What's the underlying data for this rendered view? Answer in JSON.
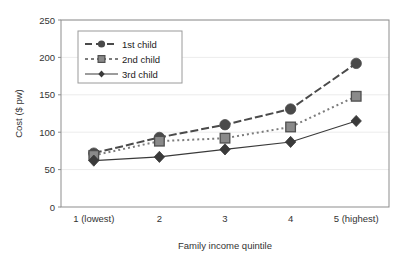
{
  "chart_data": {
    "type": "line",
    "title": "",
    "xlabel": "Family income quintile",
    "ylabel": "Cost ($ pw)",
    "categories": [
      "1 (lowest)",
      "2",
      "3",
      "4",
      "5 (highest)"
    ],
    "xtick_labels": [
      "1 (lowest)",
      "2",
      "3",
      "4",
      "5 (highest)"
    ],
    "ytick_labels": [
      "0",
      "50",
      "100",
      "150",
      "200",
      "250"
    ],
    "ylim": [
      0,
      250
    ],
    "ytick_values": [
      0,
      50,
      100,
      150,
      200,
      250
    ],
    "grid": "horizontal",
    "legend_position": "upper-left-inside",
    "series": [
      {
        "name": "1st child",
        "values": [
          72,
          93,
          110,
          131,
          192
        ],
        "marker": "circle",
        "line_style": "dash-dot",
        "color": "#4a4a4a"
      },
      {
        "name": "2nd child",
        "values": [
          69,
          88,
          92,
          107,
          148
        ],
        "marker": "square",
        "line_style": "dotted",
        "color": "#7c7c7c"
      },
      {
        "name": "3rd child",
        "values": [
          62,
          67,
          77,
          87,
          115
        ],
        "marker": "diamond",
        "line_style": "solid",
        "color": "#3a3a3a"
      }
    ]
  },
  "legend": {
    "items": [
      {
        "label": "1st child"
      },
      {
        "label": "2nd child"
      },
      {
        "label": "3rd child"
      }
    ]
  },
  "axes": {
    "y_title": "Cost ($ pw)",
    "x_title": "Family income quintile"
  }
}
